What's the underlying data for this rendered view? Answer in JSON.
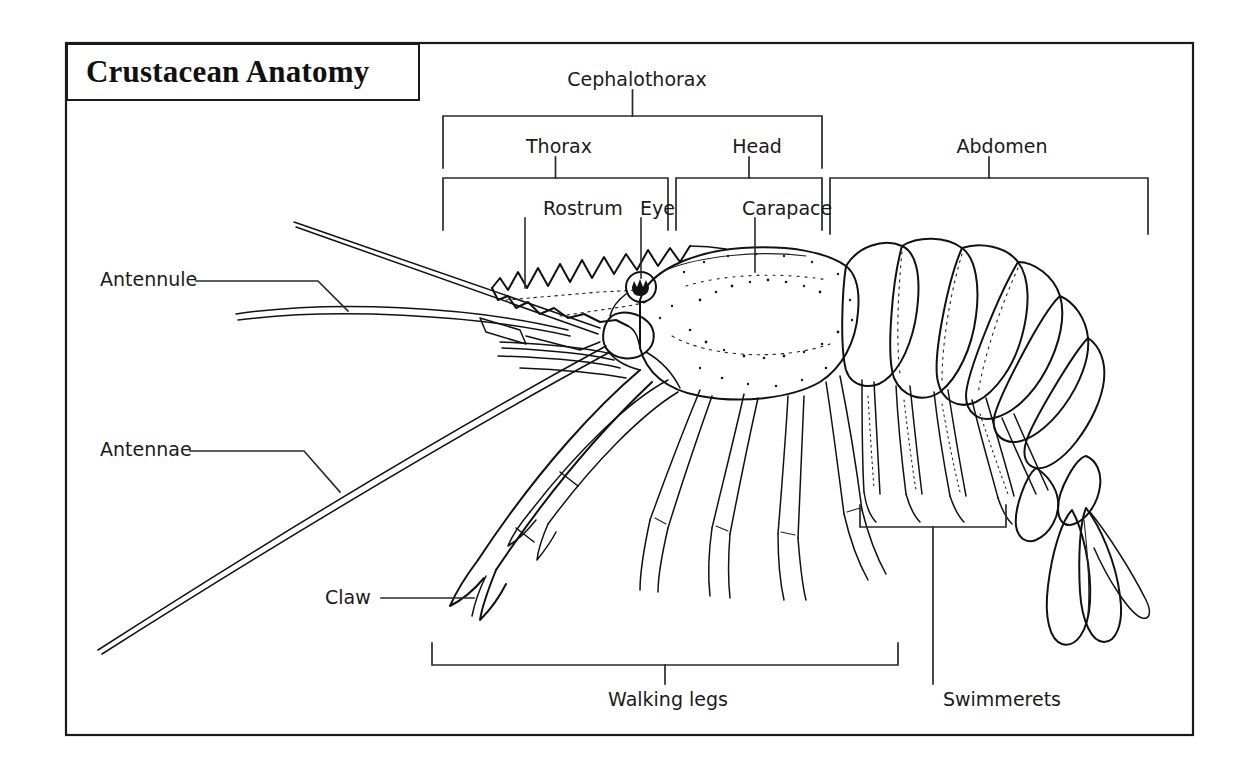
{
  "title": "Crustacean Anatomy",
  "figure": {
    "frame_color": "#1a1a1a",
    "background_color": "#ffffff",
    "ink_color": "#111111"
  },
  "brackets": [
    {
      "id": "cephalothorax",
      "label": "Cephalothorax",
      "label_x": 637,
      "label_y": 70,
      "span_left": 443,
      "span_right": 822,
      "rule_y": 116,
      "arm_depth": 52,
      "stem_top": 90,
      "orientation": "down"
    },
    {
      "id": "thorax",
      "label": "Thorax",
      "label_x": 559,
      "label_y": 137,
      "span_left": 443,
      "span_right": 668,
      "rule_y": 178,
      "arm_depth": 52,
      "stem_top": 157,
      "orientation": "down"
    },
    {
      "id": "head",
      "label": "Head",
      "label_x": 757,
      "label_y": 137,
      "span_left": 676,
      "span_right": 822,
      "rule_y": 178,
      "arm_depth": 52,
      "stem_top": 157,
      "orientation": "down"
    },
    {
      "id": "abdomen",
      "label": "Abdomen",
      "label_x": 1002,
      "label_y": 137,
      "span_left": 830,
      "span_right": 1148,
      "rule_y": 178,
      "arm_depth": 56,
      "stem_top": 157,
      "orientation": "down"
    },
    {
      "id": "walking-legs",
      "label": "Walking legs",
      "label_x": 668,
      "label_y": 690,
      "span_left": 432,
      "span_right": 898,
      "rule_y": 665,
      "arm_depth": -22,
      "stem_top": 665,
      "stem_bottom": 684,
      "orientation": "up"
    },
    {
      "id": "swimmerets",
      "label": "Swimmerets",
      "label_x": 1002,
      "label_y": 690,
      "span_left": 860,
      "span_right": 1006,
      "rule_y": 527,
      "arm_depth": -22,
      "stem_top": 527,
      "stem_bottom": 684,
      "orientation": "up"
    }
  ],
  "leaders": [
    {
      "id": "rostrum",
      "label": "Rostrum",
      "label_x": 543,
      "label_y": 199,
      "line": "M 525 218 L 525 288"
    },
    {
      "id": "eye",
      "label": "Eye",
      "label_x": 640,
      "label_y": 199,
      "line": "M 641 218 L 641 278"
    },
    {
      "id": "carapace",
      "label": "Carapace",
      "label_x": 742,
      "label_y": 199,
      "line": "M 755 218 L 755 272"
    },
    {
      "id": "antennule",
      "label": "Antennule",
      "label_x": 100,
      "label_y": 270,
      "line": "M 196 281 L 318 281 L 348 311"
    },
    {
      "id": "antennae",
      "label": "Antennae",
      "label_x": 100,
      "label_y": 440,
      "line": "M 190 451 L 304 451 L 340 492"
    },
    {
      "id": "claw",
      "label": "Claw",
      "label_x": 325,
      "label_y": 588,
      "line": "M 381 598 L 474 598"
    }
  ]
}
